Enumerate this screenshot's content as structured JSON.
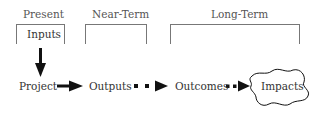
{
  "diagram": {
    "timeframes": [
      {
        "label": "Present",
        "box_label": "Inputs"
      },
      {
        "label": "Near-Term",
        "box_label": ""
      },
      {
        "label": "Long-Term",
        "box_label": ""
      }
    ],
    "flow": [
      {
        "label": "Project"
      },
      {
        "label": "Outputs"
      },
      {
        "label": "Outcomes"
      },
      {
        "label": "Impacts"
      }
    ],
    "connectors": [
      {
        "from": "Inputs",
        "to": "Project",
        "style": "solid"
      },
      {
        "from": "Project",
        "to": "Outputs",
        "style": "solid"
      },
      {
        "from": "Outputs",
        "to": "Outcomes",
        "style": "dotted"
      },
      {
        "from": "Outcomes",
        "to": "Impacts",
        "style": "dotted"
      }
    ]
  }
}
